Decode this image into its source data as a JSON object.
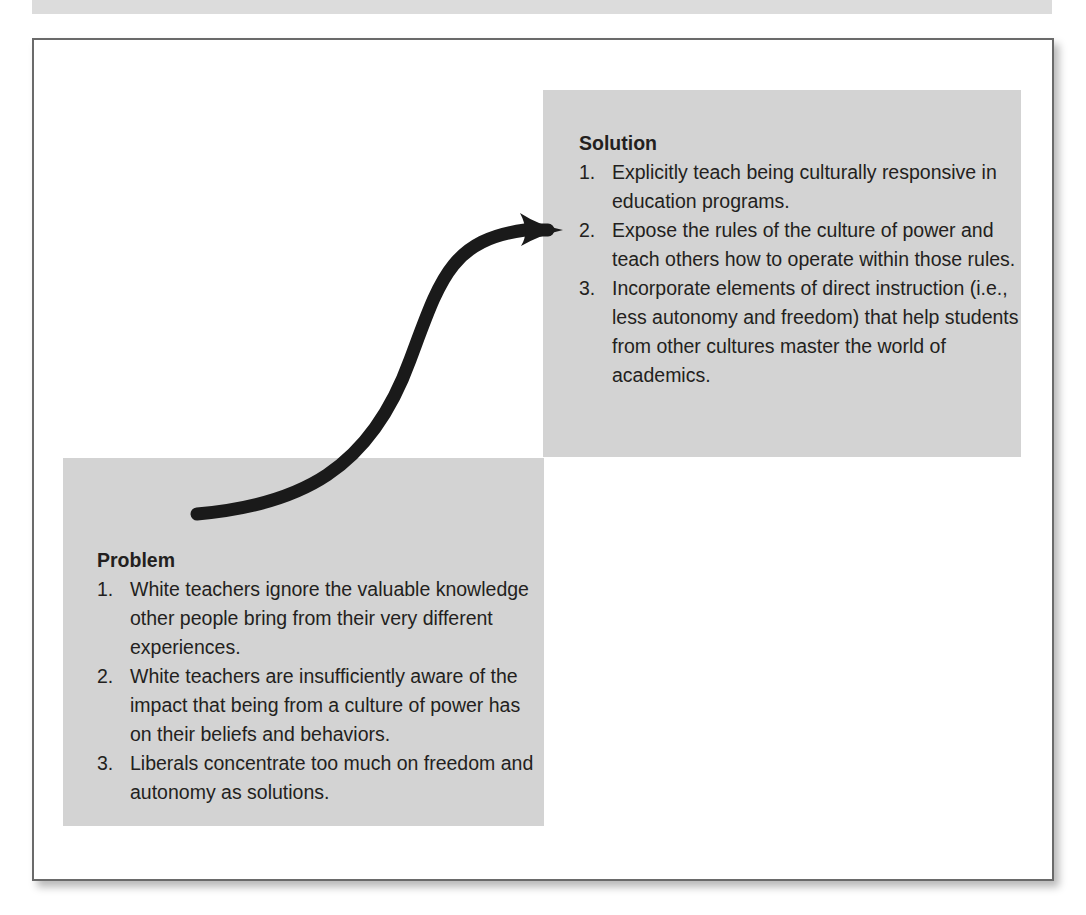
{
  "diagram": {
    "type": "problem-solution-flow",
    "solution": {
      "title": "Solution",
      "items": [
        {
          "num": "1.",
          "text": "Explicitly teach being culturally responsive in education programs."
        },
        {
          "num": "2.",
          "text": "Expose the rules of the culture of power and teach others how to operate within those rules."
        },
        {
          "num": "3.",
          "text": "Incorporate elements of direct instruction (i.e., less autonomy and freedom) that help students from other cultures master the world of academics."
        }
      ]
    },
    "problem": {
      "title": "Problem",
      "items": [
        {
          "num": "1.",
          "text": "White teachers ignore the valuable knowledge other people bring from their very different experiences."
        },
        {
          "num": "2.",
          "text": "White teachers are insufficiently aware of the impact that being from a culture of power has on their beliefs and behaviors."
        },
        {
          "num": "3.",
          "text": "Liberals concentrate too much on freedom and autonomy as solutions."
        }
      ]
    },
    "arrow": {
      "from": "problem",
      "to": "solution",
      "color": "#1a1a1a"
    },
    "colors": {
      "box_fill": "#d3d3d3",
      "frame_border": "#6a6a6a",
      "text": "#231f20"
    }
  }
}
